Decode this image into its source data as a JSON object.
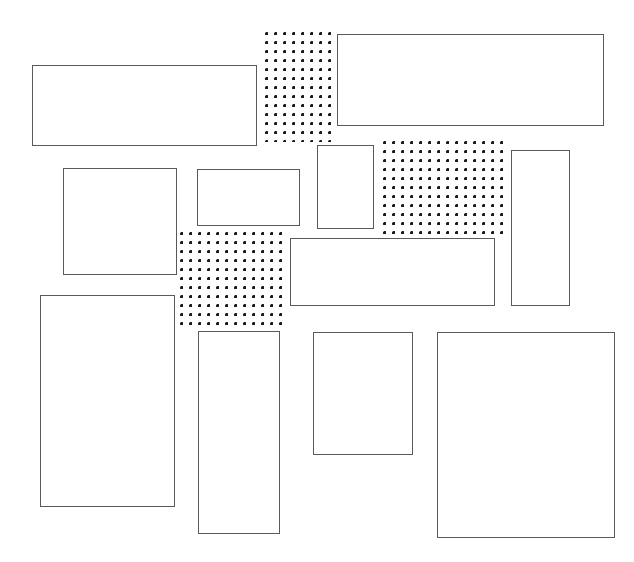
{
  "canvas": {
    "width": 634,
    "height": 562,
    "background_color": "#ffffff",
    "title": "Abstract rectangle layout"
  },
  "style": {
    "outline_color": "#5a5a5a",
    "outline_width_px": 1,
    "fill_color": "#ffffff",
    "dot_color": "#1a1a1a",
    "dot_spacing_px": 9,
    "dot_radius_px": 1.4
  },
  "shapes": [
    {
      "id": "dotted-top",
      "name": "dotted-region-top",
      "kind": "dotted",
      "x": 265,
      "y": 32,
      "width": 69,
      "height": 110,
      "label": ""
    },
    {
      "id": "rect-top-right",
      "name": "rectangle-top-right",
      "kind": "outline",
      "x": 337,
      "y": 34,
      "width": 267,
      "height": 92,
      "label": ""
    },
    {
      "id": "rect-top-left",
      "name": "rectangle-top-left",
      "kind": "outline",
      "x": 32,
      "y": 65,
      "width": 225,
      "height": 81,
      "label": ""
    },
    {
      "id": "dotted-right",
      "name": "dotted-region-right",
      "kind": "dotted",
      "x": 383,
      "y": 141,
      "width": 125,
      "height": 93,
      "label": ""
    },
    {
      "id": "rect-small-vertical",
      "name": "rectangle-small-vertical",
      "kind": "outline",
      "x": 317,
      "y": 145,
      "width": 57,
      "height": 84,
      "label": ""
    },
    {
      "id": "rect-tall-right",
      "name": "rectangle-tall-right",
      "kind": "outline",
      "x": 511,
      "y": 150,
      "width": 59,
      "height": 156,
      "label": ""
    },
    {
      "id": "rect-mid-square",
      "name": "rectangle-mid-left-square",
      "kind": "outline",
      "x": 63,
      "y": 168,
      "width": 114,
      "height": 107,
      "label": ""
    },
    {
      "id": "rect-mid-small",
      "name": "rectangle-mid-small",
      "kind": "outline",
      "x": 197,
      "y": 169,
      "width": 103,
      "height": 57,
      "label": ""
    },
    {
      "id": "dotted-middle",
      "name": "dotted-region-middle",
      "kind": "dotted",
      "x": 180,
      "y": 232,
      "width": 105,
      "height": 93,
      "label": ""
    },
    {
      "id": "rect-mid-wide",
      "name": "rectangle-middle-wide",
      "kind": "outline",
      "x": 290,
      "y": 238,
      "width": 205,
      "height": 68,
      "label": ""
    },
    {
      "id": "rect-bottom-left",
      "name": "rectangle-bottom-left-tall",
      "kind": "outline",
      "x": 40,
      "y": 295,
      "width": 135,
      "height": 212,
      "label": ""
    },
    {
      "id": "rect-bottom-narrow",
      "name": "rectangle-bottom-narrow-tall",
      "kind": "outline",
      "x": 198,
      "y": 331,
      "width": 82,
      "height": 203,
      "label": ""
    },
    {
      "id": "rect-bottom-mid",
      "name": "rectangle-bottom-middle",
      "kind": "outline",
      "x": 313,
      "y": 332,
      "width": 100,
      "height": 123,
      "label": ""
    },
    {
      "id": "rect-bottom-right",
      "name": "rectangle-bottom-right-large",
      "kind": "outline",
      "x": 437,
      "y": 332,
      "width": 178,
      "height": 206,
      "label": ""
    }
  ]
}
